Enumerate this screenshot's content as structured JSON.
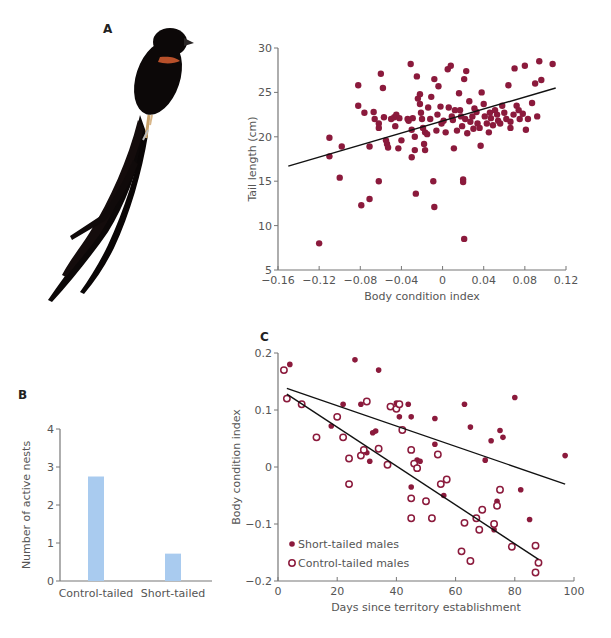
{
  "panels": {
    "a_label": "A",
    "b_label": "B",
    "c_label": "C"
  },
  "colors": {
    "point": "#8b1a3c",
    "bar": "#a9cbef",
    "axis": "#777777",
    "line": "#111111",
    "bird_body": "#0c0808",
    "bird_collar": "#b8502a"
  },
  "chart_data": [
    {
      "id": "A",
      "type": "scatter",
      "title": "",
      "xlabel": "Body condition index",
      "ylabel": "Tail length (cm)",
      "xlim": [
        -0.16,
        0.12
      ],
      "ylim": [
        5,
        30
      ],
      "xticks": [
        "−0.16",
        "−0.12",
        "−0.08",
        "−0.04",
        "0",
        "0.04",
        "0.08",
        "0.12"
      ],
      "yticks": [
        "5",
        "10",
        "15",
        "20",
        "25",
        "30"
      ],
      "regression_line": [
        [
          -0.15,
          16.7
        ],
        [
          0.11,
          25.5
        ]
      ],
      "points": [
        [
          -0.12,
          8.0
        ],
        [
          -0.11,
          19.9
        ],
        [
          -0.11,
          17.8
        ],
        [
          -0.1,
          15.4
        ],
        [
          -0.098,
          18.9
        ],
        [
          -0.082,
          25.8
        ],
        [
          -0.082,
          23.5
        ],
        [
          -0.079,
          12.3
        ],
        [
          -0.076,
          22.7
        ],
        [
          -0.071,
          13.0
        ],
        [
          -0.071,
          18.9
        ],
        [
          -0.067,
          22.8
        ],
        [
          -0.066,
          22.0
        ],
        [
          -0.062,
          21.5
        ],
        [
          -0.062,
          21.0
        ],
        [
          -0.062,
          15.0
        ],
        [
          -0.06,
          27.1
        ],
        [
          -0.058,
          25.5
        ],
        [
          -0.057,
          22.2
        ],
        [
          -0.055,
          19.6
        ],
        [
          -0.054,
          19.2
        ],
        [
          -0.053,
          18.8
        ],
        [
          -0.05,
          22.0
        ],
        [
          -0.047,
          22.2
        ],
        [
          -0.046,
          21.2
        ],
        [
          -0.045,
          22.5
        ],
        [
          -0.043,
          18.7
        ],
        [
          -0.042,
          22.1
        ],
        [
          -0.04,
          19.6
        ],
        [
          -0.034,
          22.0
        ],
        [
          -0.033,
          21.8
        ],
        [
          -0.031,
          28.2
        ],
        [
          -0.03,
          20.8
        ],
        [
          -0.03,
          17.7
        ],
        [
          -0.029,
          22.1
        ],
        [
          -0.027,
          20.0
        ],
        [
          -0.027,
          18.5
        ],
        [
          -0.026,
          13.6
        ],
        [
          -0.025,
          26.8
        ],
        [
          -0.024,
          24.3
        ],
        [
          -0.022,
          23.7
        ],
        [
          -0.022,
          24.8
        ],
        [
          -0.021,
          22.7
        ],
        [
          -0.02,
          22.0
        ],
        [
          -0.019,
          21.0
        ],
        [
          -0.018,
          19.2
        ],
        [
          -0.017,
          20.5
        ],
        [
          -0.017,
          18.5
        ],
        [
          -0.015,
          20.3
        ],
        [
          -0.014,
          23.3
        ],
        [
          -0.012,
          22.0
        ],
        [
          -0.011,
          24.5
        ],
        [
          -0.009,
          15.0
        ],
        [
          -0.008,
          12.1
        ],
        [
          -0.008,
          26.5
        ],
        [
          -0.006,
          20.7
        ],
        [
          -0.005,
          22.5
        ],
        [
          -0.004,
          25.7
        ],
        [
          -0.002,
          23.4
        ],
        [
          -0.001,
          21.5
        ],
        [
          0.001,
          21.8
        ],
        [
          0.003,
          20.5
        ],
        [
          0.005,
          27.6
        ],
        [
          0.006,
          23.3
        ],
        [
          0.008,
          28.0
        ],
        [
          0.009,
          22.3
        ],
        [
          0.01,
          21.9
        ],
        [
          0.011,
          18.7
        ],
        [
          0.012,
          23.0
        ],
        [
          0.014,
          20.7
        ],
        [
          0.016,
          24.9
        ],
        [
          0.017,
          23.0
        ],
        [
          0.018,
          22.3
        ],
        [
          0.019,
          21.2
        ],
        [
          0.02,
          15.2
        ],
        [
          0.02,
          14.9
        ],
        [
          0.021,
          26.5
        ],
        [
          0.021,
          8.5
        ],
        [
          0.022,
          22.0
        ],
        [
          0.023,
          27.4
        ],
        [
          0.024,
          20.4
        ],
        [
          0.026,
          24.0
        ],
        [
          0.027,
          21.7
        ],
        [
          0.029,
          22.3
        ],
        [
          0.03,
          20.9
        ],
        [
          0.031,
          23.2
        ],
        [
          0.033,
          22.8
        ],
        [
          0.034,
          21.5
        ],
        [
          0.036,
          21.0
        ],
        [
          0.037,
          19.0
        ],
        [
          0.038,
          25.0
        ],
        [
          0.04,
          23.7
        ],
        [
          0.041,
          22.3
        ],
        [
          0.043,
          21.5
        ],
        [
          0.045,
          20.5
        ],
        [
          0.046,
          22.7
        ],
        [
          0.047,
          22.1
        ],
        [
          0.049,
          21.3
        ],
        [
          0.051,
          23.0
        ],
        [
          0.053,
          22.5
        ],
        [
          0.054,
          21.8
        ],
        [
          0.056,
          21.5
        ],
        [
          0.058,
          23.5
        ],
        [
          0.06,
          22.7
        ],
        [
          0.062,
          22.0
        ],
        [
          0.064,
          25.8
        ],
        [
          0.066,
          21.7
        ],
        [
          0.066,
          21.0
        ],
        [
          0.069,
          22.5
        ],
        [
          0.07,
          27.7
        ],
        [
          0.072,
          23.5
        ],
        [
          0.074,
          23.0
        ],
        [
          0.075,
          22.0
        ],
        [
          0.078,
          22.6
        ],
        [
          0.08,
          28.0
        ],
        [
          0.081,
          20.8
        ],
        [
          0.083,
          22.0
        ],
        [
          0.087,
          23.8
        ],
        [
          0.09,
          26.0
        ],
        [
          0.092,
          22.3
        ],
        [
          0.094,
          28.5
        ],
        [
          0.096,
          26.4
        ],
        [
          0.107,
          28.2
        ]
      ]
    },
    {
      "id": "B",
      "type": "bar",
      "title": "",
      "xlabel": "",
      "ylabel": "Number of active nests",
      "ylim": [
        0,
        4
      ],
      "yticks": [
        "0",
        "1",
        "2",
        "3",
        "4"
      ],
      "categories": [
        "Control-tailed",
        "Short-tailed"
      ],
      "values": [
        2.75,
        0.72
      ]
    },
    {
      "id": "C",
      "type": "scatter",
      "title": "",
      "xlabel": "Days since territory establishment",
      "ylabel": "Body condition index",
      "xlim": [
        0,
        100
      ],
      "ylim": [
        -0.2,
        0.2
      ],
      "xticks": [
        "0",
        "20",
        "40",
        "60",
        "80",
        "100"
      ],
      "yticks": [
        "−0.2",
        "−0.1",
        "0",
        "0.1",
        "0.2"
      ],
      "legend": {
        "position": "lower left",
        "entries": [
          "Short-tailed males",
          "Control-tailed males"
        ]
      },
      "series": [
        {
          "name": "Short-tailed males",
          "marker": "filled",
          "regression_line": [
            [
              3,
              0.138
            ],
            [
              97,
              -0.03
            ]
          ],
          "points": [
            [
              4,
              0.18
            ],
            [
              26,
              0.188
            ],
            [
              18,
              0.072
            ],
            [
              22,
              0.11
            ],
            [
              28,
              0.11
            ],
            [
              34,
              0.17
            ],
            [
              33,
              0.063
            ],
            [
              32,
              0.06
            ],
            [
              30,
              0.025
            ],
            [
              31,
              0.01
            ],
            [
              40,
              0.112
            ],
            [
              41,
              0.088
            ],
            [
              44,
              0.11
            ],
            [
              45,
              0.088
            ],
            [
              47,
              0.012
            ],
            [
              45,
              -0.035
            ],
            [
              48,
              0.01
            ],
            [
              53,
              0.085
            ],
            [
              53,
              0.04
            ],
            [
              56,
              -0.05
            ],
            [
              63,
              0.11
            ],
            [
              65,
              0.07
            ],
            [
              70,
              0.012
            ],
            [
              72,
              0.046
            ],
            [
              75,
              0.064
            ],
            [
              80,
              0.122
            ],
            [
              76,
              0.052
            ],
            [
              74,
              -0.06
            ],
            [
              82,
              -0.04
            ],
            [
              85,
              -0.092
            ],
            [
              73,
              -0.11
            ],
            [
              97,
              0.02
            ]
          ]
        },
        {
          "name": "Control-tailed males",
          "marker": "open",
          "regression_line": [
            [
              3,
              0.128
            ],
            [
              88,
              -0.162
            ]
          ],
          "points": [
            [
              2,
              0.17
            ],
            [
              3,
              0.12
            ],
            [
              8,
              0.11
            ],
            [
              20,
              0.088
            ],
            [
              13,
              0.052
            ],
            [
              22,
              0.052
            ],
            [
              24,
              0.015
            ],
            [
              24,
              -0.03
            ],
            [
              28,
              0.02
            ],
            [
              29,
              0.03
            ],
            [
              30,
              0.115
            ],
            [
              34,
              0.032
            ],
            [
              37,
              0.004
            ],
            [
              38,
              0.106
            ],
            [
              40,
              0.102
            ],
            [
              41,
              0.11
            ],
            [
              42,
              0.065
            ],
            [
              45,
              0.03
            ],
            [
              46,
              0.006
            ],
            [
              47,
              -0.002
            ],
            [
              45,
              -0.055
            ],
            [
              45,
              -0.09
            ],
            [
              50,
              -0.06
            ],
            [
              52,
              -0.09
            ],
            [
              54,
              0.022
            ],
            [
              55,
              -0.03
            ],
            [
              57,
              -0.022
            ],
            [
              62,
              -0.148
            ],
            [
              63,
              -0.098
            ],
            [
              65,
              -0.165
            ],
            [
              67,
              -0.09
            ],
            [
              68,
              -0.11
            ],
            [
              69,
              -0.075
            ],
            [
              73,
              -0.1
            ],
            [
              74,
              -0.068
            ],
            [
              75,
              -0.04
            ],
            [
              79,
              -0.14
            ],
            [
              87,
              -0.185
            ],
            [
              87,
              -0.138
            ],
            [
              88,
              -0.168
            ]
          ]
        }
      ]
    }
  ]
}
